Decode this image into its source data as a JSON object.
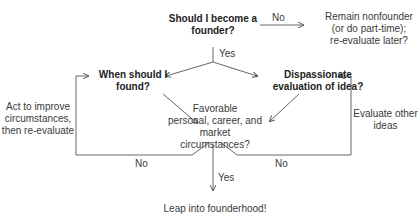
{
  "nodes": {
    "q_founder": "Should I become a\nfounder?",
    "remain": "Remain nonfounder\n(or do part-time);\nre-evaluate later?",
    "when": "When should I\nfound?",
    "dispassionate": "Dispassionate\nevaluation of idea?",
    "favorable": "Favorable\npersonal, career, and market\ncircumstances?",
    "leap": "Leap into founderhood!",
    "act": "Act to improve\ncircumstances,\nthen re-evaluate",
    "evaluate_other": "Evaluate other\nideas"
  },
  "edges": {
    "no_top": "No",
    "yes_top": "Yes",
    "no_left": "No",
    "no_right": "No",
    "yes_bottom": "Yes"
  },
  "colors": {
    "line": "#555555",
    "text": "#333333"
  }
}
